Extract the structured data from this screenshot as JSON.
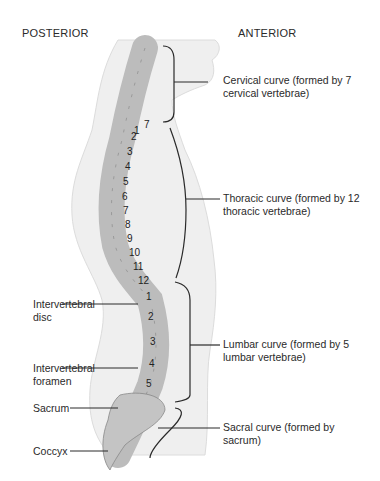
{
  "headers": {
    "posterior": "POSTERIOR",
    "anterior": "ANTERIOR"
  },
  "right_labels": [
    {
      "id": "cervical",
      "line1": "Cervical curve (formed by 7",
      "line2": "cervical vertebrae)"
    },
    {
      "id": "thoracic",
      "line1": "Thoracic curve (formed by 12",
      "line2": "thoracic vertebrae)"
    },
    {
      "id": "lumbar",
      "line1": "Lumbar curve (formed by 5",
      "line2": "lumbar vertebrae)"
    },
    {
      "id": "sacral",
      "line1": "Sacral curve (formed by",
      "line2": "sacrum)"
    }
  ],
  "left_labels": [
    {
      "id": "disc",
      "line1": "Intervertebral",
      "line2": "disc"
    },
    {
      "id": "foramen",
      "line1": "Intervertebral",
      "line2": "foramen"
    },
    {
      "id": "sacrum",
      "line1": "Sacrum",
      "line2": ""
    },
    {
      "id": "coccyx",
      "line1": "Coccyx",
      "line2": ""
    }
  ],
  "vertebra_numbers": {
    "cervical": [
      "7"
    ],
    "thoracic": [
      "1",
      "2",
      "3",
      "4",
      "5",
      "6",
      "7",
      "8",
      "9",
      "10",
      "11",
      "12"
    ],
    "lumbar": [
      "1",
      "2",
      "3",
      "4",
      "5"
    ]
  },
  "colors": {
    "bone": "#c9c9c9",
    "bone_dark": "#8a8a8a",
    "body_shade": "#e6e6e6",
    "line": "#2a2a2a"
  }
}
